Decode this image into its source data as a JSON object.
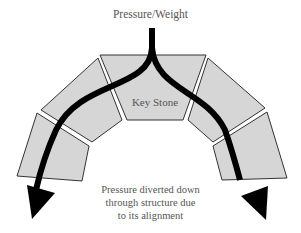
{
  "labels": {
    "top": "Pressure/Weight",
    "key_stone": "Key Stone",
    "note_line1": "Pressure diverted down",
    "note_line2": "through structure due",
    "note_line3": "to its alignment"
  },
  "colors": {
    "stone_fill": "#d6d6d6",
    "stone_stroke": "#333333",
    "arrow": "#000000",
    "text": "#555555"
  }
}
